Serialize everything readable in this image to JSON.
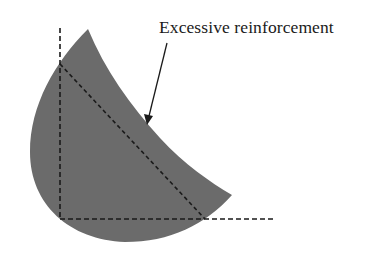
{
  "diagram": {
    "annotation": {
      "label": "Excessive reinforcement",
      "arrow_from": [
        167,
        43
      ],
      "arrow_to": [
        147,
        124
      ]
    },
    "shape": {
      "description": "Gray curved region (reinforcement zone)",
      "fill": "#6b6b6b"
    },
    "guides": {
      "vertical_dashed": {
        "x": 60,
        "y_top": 28,
        "y_bottom": 219
      },
      "horizontal_dashed": {
        "y": 219,
        "x_left": 60,
        "x_right": 275
      },
      "diagonal_dashed": {
        "from": [
          60,
          64
        ],
        "to": [
          205,
          219
        ]
      },
      "stroke": "#1a1a1a"
    }
  }
}
